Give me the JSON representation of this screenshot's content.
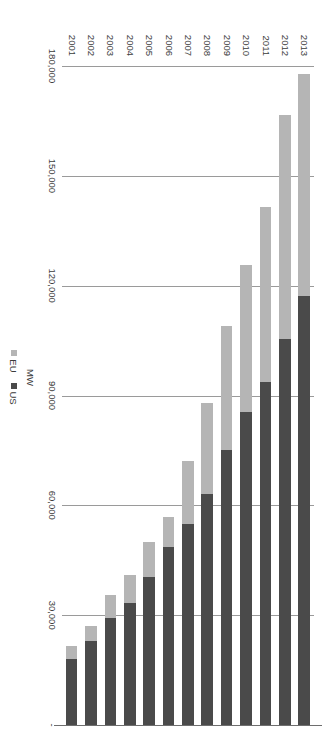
{
  "chart_data": {
    "type": "bar",
    "orientation": "horizontal-stacked",
    "title": "",
    "subtitle": "",
    "xlabel": "MW",
    "ylabel": "",
    "categories": [
      "2001",
      "2002",
      "2003",
      "2004",
      "2005",
      "2006",
      "2007",
      "2008",
      "2009",
      "2010",
      "2011",
      "2012",
      "2013"
    ],
    "series": [
      {
        "name": "US",
        "color": "#4a4a4a",
        "values": [
          18000,
          22900,
          29100,
          33300,
          40300,
          48500,
          54800,
          63000,
          75000,
          85400,
          93700,
          105500,
          117300
        ]
      },
      {
        "name": "EU",
        "color": "#b5b5b5",
        "values": [
          3500,
          4200,
          6300,
          7600,
          9700,
          8300,
          17400,
          25000,
          34000,
          40200,
          47900,
          61100,
          60400
        ]
      }
    ],
    "totals": [
      21500,
      27100,
      35400,
      40900,
      50000,
      56800,
      72200,
      88000,
      109000,
      125600,
      141600,
      166600,
      177700
    ],
    "xticks": [
      0,
      30000,
      60000,
      90000,
      120000,
      150000,
      180000
    ],
    "xtick_labels": [
      "-",
      "30,000",
      "60,000",
      "90,000",
      "120,000",
      "150,000",
      "180,000"
    ],
    "xlim": [
      0,
      180000
    ],
    "grid": true,
    "legend": {
      "position": "bottom",
      "entries": [
        {
          "label": "EU",
          "color": "#b5b5b5"
        },
        {
          "label": "US",
          "color": "#4a4a4a"
        }
      ]
    },
    "stack_order": [
      "US",
      "EU"
    ],
    "rotation_degrees": 90
  }
}
